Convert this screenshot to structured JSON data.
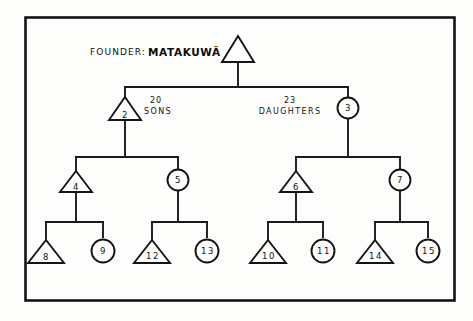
{
  "figure": {
    "type": "kinship-genealogy-diagram",
    "background_color": "#fdfdfb",
    "ink_color": "#141414",
    "caption": {
      "prefix": "FOUNDER:",
      "name": "MATAKUWÄ"
    },
    "branch_labels": [
      {
        "id": "sons-branch",
        "count": "20",
        "word": "SONS"
      },
      {
        "id": "daughters-branch",
        "count": "23",
        "word": "DAUGHTERS"
      }
    ],
    "legend_meaning": {
      "triangle": "male",
      "circle": "female"
    },
    "nodes": [
      {
        "id": "founder",
        "label": "",
        "shape": "triangle",
        "generation": 1
      },
      {
        "id": "n2",
        "label": "2",
        "shape": "triangle",
        "generation": 2
      },
      {
        "id": "n3",
        "label": "3",
        "shape": "circle",
        "generation": 2
      },
      {
        "id": "n4",
        "label": "4",
        "shape": "triangle",
        "generation": 3
      },
      {
        "id": "n5",
        "label": "5",
        "shape": "circle",
        "generation": 3
      },
      {
        "id": "n6",
        "label": "6",
        "shape": "triangle",
        "generation": 3
      },
      {
        "id": "n7",
        "label": "7",
        "shape": "circle",
        "generation": 3
      },
      {
        "id": "n8",
        "label": "8",
        "shape": "triangle",
        "generation": 4
      },
      {
        "id": "n9",
        "label": "9",
        "shape": "circle",
        "generation": 4
      },
      {
        "id": "n12",
        "label": "12",
        "shape": "triangle",
        "generation": 4
      },
      {
        "id": "n13",
        "label": "13",
        "shape": "circle",
        "generation": 4
      },
      {
        "id": "n10",
        "label": "10",
        "shape": "triangle",
        "generation": 4
      },
      {
        "id": "n11",
        "label": "11",
        "shape": "circle",
        "generation": 4
      },
      {
        "id": "n14",
        "label": "14",
        "shape": "triangle",
        "generation": 4
      },
      {
        "id": "n15",
        "label": "15",
        "shape": "circle",
        "generation": 4
      }
    ],
    "edges": [
      {
        "from": "founder",
        "to": "n2"
      },
      {
        "from": "founder",
        "to": "n3"
      },
      {
        "from": "n2",
        "to": "n4"
      },
      {
        "from": "n2",
        "to": "n5"
      },
      {
        "from": "n3",
        "to": "n6"
      },
      {
        "from": "n3",
        "to": "n7"
      },
      {
        "from": "n4",
        "to": "n8"
      },
      {
        "from": "n4",
        "to": "n9"
      },
      {
        "from": "n5",
        "to": "n12"
      },
      {
        "from": "n5",
        "to": "n13"
      },
      {
        "from": "n6",
        "to": "n10"
      },
      {
        "from": "n6",
        "to": "n11"
      },
      {
        "from": "n7",
        "to": "n14"
      },
      {
        "from": "n7",
        "to": "n15"
      }
    ]
  }
}
